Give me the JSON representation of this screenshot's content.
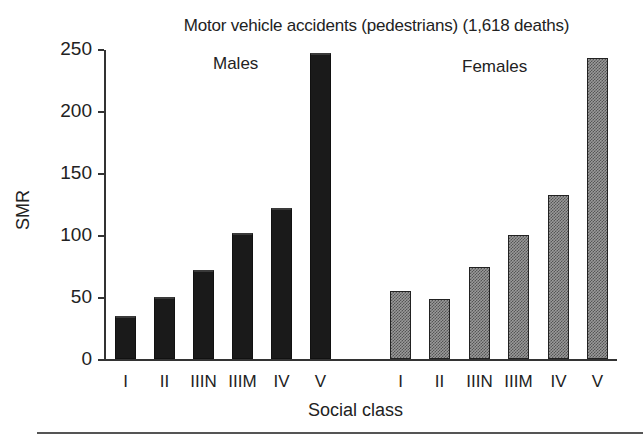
{
  "chart_data": {
    "type": "bar",
    "title": "Motor vehicle accidents (pedestrians) (1,618 deaths)",
    "xlabel": "Social class",
    "ylabel": "SMR",
    "ylim": [
      0,
      250
    ],
    "yticks": [
      0,
      50,
      100,
      150,
      200,
      250
    ],
    "grid": false,
    "legend": "group labels above bars",
    "categories": [
      "I",
      "II",
      "IIIN",
      "IIIM",
      "IV",
      "V"
    ],
    "series": [
      {
        "name": "Males",
        "color": "#1a1a1a",
        "values": [
          35,
          50,
          72,
          102,
          122,
          247
        ]
      },
      {
        "name": "Females",
        "color": "#9a9a9a",
        "pattern": "dotted-hatch",
        "values": [
          55,
          48,
          74,
          100,
          132,
          243
        ]
      }
    ]
  },
  "labels": {
    "title": "Motor vehicle accidents (pedestrians) (1,618 deaths)",
    "ylabel": "SMR",
    "xlabel": "Social class",
    "males": "Males",
    "females": "Females",
    "yticks": [
      "0",
      "50",
      "100",
      "150",
      "200",
      "250"
    ],
    "categories": [
      "I",
      "II",
      "IIIN",
      "IIIM",
      "IV",
      "V"
    ]
  }
}
